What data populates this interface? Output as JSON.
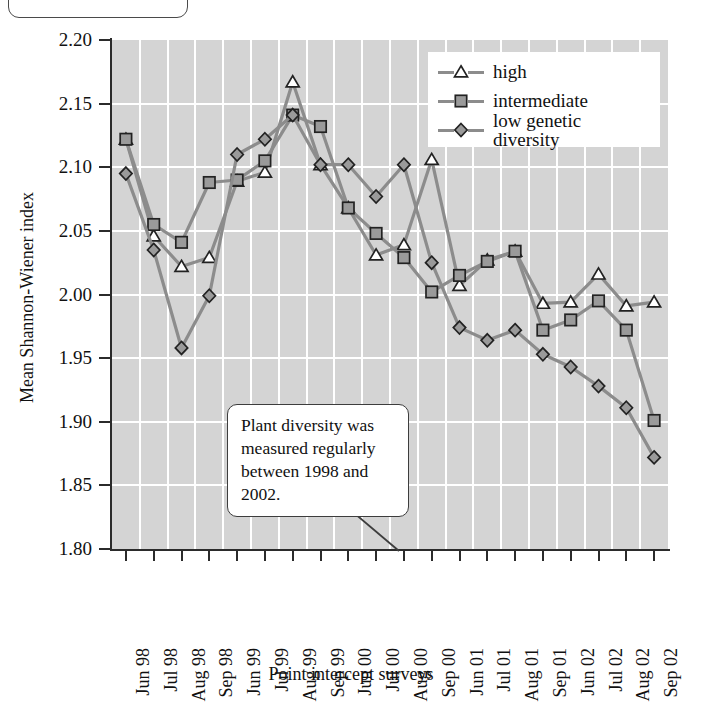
{
  "annotation": {
    "text": "Plant diversity was measured regularly between 1998 and 2002."
  },
  "colors": {
    "plot_background": "#d4d4d4",
    "gridline": "#ffffff",
    "line": "#8c8c8c",
    "marker_fill": "#9a9a9a",
    "marker_stroke": "#222222",
    "axis": "#2b2b2b"
  },
  "chart_data": {
    "type": "line",
    "title": "",
    "xlabel": "Point intercept surveys",
    "ylabel": "Mean Shannon-Wiener index",
    "ylim": [
      1.8,
      2.2
    ],
    "yticks": [
      "2.20",
      "2.15",
      "2.10",
      "2.05",
      "2.00",
      "1.95",
      "1.90",
      "1.85",
      "1.80"
    ],
    "ytick_values": [
      2.2,
      2.15,
      2.1,
      2.05,
      2.0,
      1.95,
      1.9,
      1.85,
      1.8
    ],
    "grid": true,
    "legend_position": "top-right",
    "categories": [
      "Jun 98",
      "Jul 98",
      "Aug 98",
      "Sep 98",
      "Jun 99",
      "Jul 99",
      "Aug 99",
      "Sep 99",
      "Jun 00",
      "Jul 00",
      "Aug 00",
      "Sep 00",
      "Jun 01",
      "Jul 01",
      "Aug 01",
      "Sep 01",
      "Jun 02",
      "Jul 02",
      "Aug 02",
      "Sep 02"
    ],
    "series": [
      {
        "name": "high",
        "marker": "triangle",
        "values": [
          2.122,
          2.046,
          2.022,
          2.029,
          2.089,
          2.096,
          2.167,
          2.102,
          2.068,
          2.031,
          2.039,
          2.106,
          2.007,
          2.027,
          2.034,
          1.993,
          1.994,
          2.016,
          1.991,
          1.994
        ]
      },
      {
        "name": "intermediate",
        "marker": "square",
        "values": [
          2.122,
          2.055,
          2.041,
          2.088,
          2.09,
          2.105,
          2.141,
          2.132,
          2.068,
          2.048,
          2.029,
          2.002,
          2.015,
          2.026,
          2.034,
          1.972,
          1.98,
          1.995,
          1.972,
          1.901
        ]
      },
      {
        "name": "low genetic diversity",
        "marker": "diamond",
        "values": [
          2.095,
          2.035,
          1.958,
          1.999,
          2.11,
          2.122,
          2.141,
          2.102,
          2.102,
          2.077,
          2.102,
          2.025,
          1.974,
          1.964,
          1.972,
          1.953,
          1.943,
          1.928,
          1.911,
          1.872
        ]
      }
    ]
  },
  "legend": {
    "items": [
      {
        "label": "high",
        "marker": "triangle"
      },
      {
        "label": "intermediate",
        "marker": "square"
      },
      {
        "label": "low genetic diversity",
        "marker": "diamond"
      }
    ]
  }
}
